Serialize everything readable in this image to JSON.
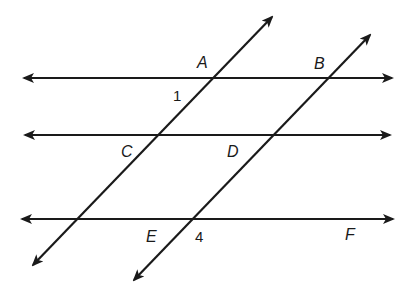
{
  "diagram": {
    "line_color": "#1a1a1a",
    "background": "#ffffff",
    "lines": [
      {
        "id": "line-AB",
        "type": "horizontal",
        "x1": 24,
        "y1": 78,
        "x2": 392,
        "y2": 78,
        "arrows": "both"
      },
      {
        "id": "line-CD",
        "type": "horizontal",
        "x1": 25,
        "y1": 135,
        "x2": 390,
        "y2": 135,
        "arrows": "both"
      },
      {
        "id": "line-EF",
        "type": "horizontal",
        "x1": 22,
        "y1": 219,
        "x2": 393,
        "y2": 219,
        "arrows": "both"
      },
      {
        "id": "transversal-AC",
        "type": "transversal",
        "x1": 272,
        "y1": 17,
        "x2": 33,
        "y2": 265,
        "arrows": "both"
      },
      {
        "id": "transversal-BDE",
        "type": "transversal",
        "x1": 370,
        "y1": 35,
        "x2": 134,
        "y2": 280,
        "arrows": "both"
      }
    ],
    "point_labels": {
      "A": "A",
      "B": "B",
      "C": "C",
      "D": "D",
      "E": "E",
      "F": "F"
    },
    "angle_labels": {
      "angle1": "1",
      "angle4": "4"
    }
  }
}
